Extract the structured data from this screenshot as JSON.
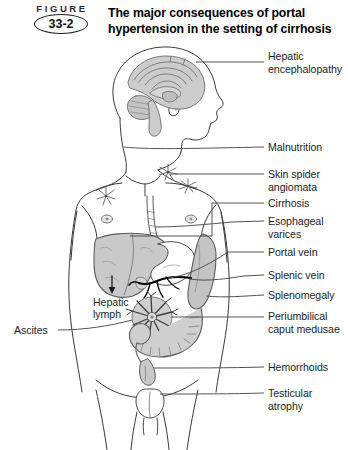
{
  "figure": {
    "word": "FIGURE",
    "number": "33-2",
    "title": "The major consequences of portal hypertension in the setting of cirrhosis"
  },
  "colors": {
    "background": "#ffffff",
    "outline": "#3a3a3a",
    "organ_fill": "#c9c9c9",
    "organ_stroke": "#6b6b6b",
    "vessel": "#000000",
    "leader_line": "#4a4a4a",
    "text": "#1c1c1c"
  },
  "labels": {
    "right": [
      {
        "id": "hepatic-encephalopathy",
        "text": "Hepatic\nencephalopathy",
        "x": 268,
        "y": 56
      },
      {
        "id": "malnutrition",
        "text": "Malnutrition",
        "x": 268,
        "y": 142
      },
      {
        "id": "skin-spider-angiomata",
        "text": "Skin spider\nangiomata",
        "x": 268,
        "y": 171
      },
      {
        "id": "cirrhosis",
        "text": "Cirrhosis",
        "x": 268,
        "y": 198
      },
      {
        "id": "esophageal-varices",
        "text": "Esophageal\nvarices",
        "x": 268,
        "y": 216
      },
      {
        "id": "portal-vein",
        "text": "Portal vein",
        "x": 268,
        "y": 247
      },
      {
        "id": "splenic-vein",
        "text": "Splenic vein",
        "x": 268,
        "y": 270
      },
      {
        "id": "splenomegaly",
        "text": "Splenomegaly",
        "x": 268,
        "y": 290
      },
      {
        "id": "periumbilical-caput-medusae",
        "text": "Periumbilical\ncaput medusae",
        "x": 268,
        "y": 311
      },
      {
        "id": "hemorrhoids",
        "text": "Hemorrhoids",
        "x": 268,
        "y": 362
      },
      {
        "id": "testicular-atrophy",
        "text": "Testicular\natrophy",
        "x": 268,
        "y": 388
      }
    ],
    "left": [
      {
        "id": "ascites",
        "text": "Ascites",
        "x": 14,
        "y": 324
      }
    ],
    "inline": [
      {
        "id": "hepatic-lymph",
        "text": "Hepatic\nlymph",
        "x": 93,
        "y": 296
      }
    ]
  },
  "anatomy": {
    "parts": [
      "head-profile",
      "brain-sagittal",
      "neck",
      "torso-outline",
      "arms",
      "nipple-left",
      "nipple-right",
      "spider-angioma-1",
      "spider-angioma-2",
      "spider-angioma-3",
      "esophagus",
      "liver",
      "stomach",
      "spleen",
      "portal-vein",
      "splenic-vein",
      "caput-medusae",
      "colon",
      "rectum",
      "scrotum",
      "legs",
      "hepatic-lymph-arrow"
    ]
  }
}
